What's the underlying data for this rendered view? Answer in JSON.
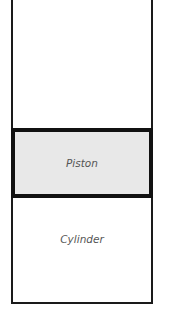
{
  "diagram": {
    "piston": {
      "label": "Piston",
      "fill": "#e8e8e8",
      "border": "#111111"
    },
    "cylinder": {
      "label": "Cylinder",
      "line": "#1a1a1a"
    }
  }
}
